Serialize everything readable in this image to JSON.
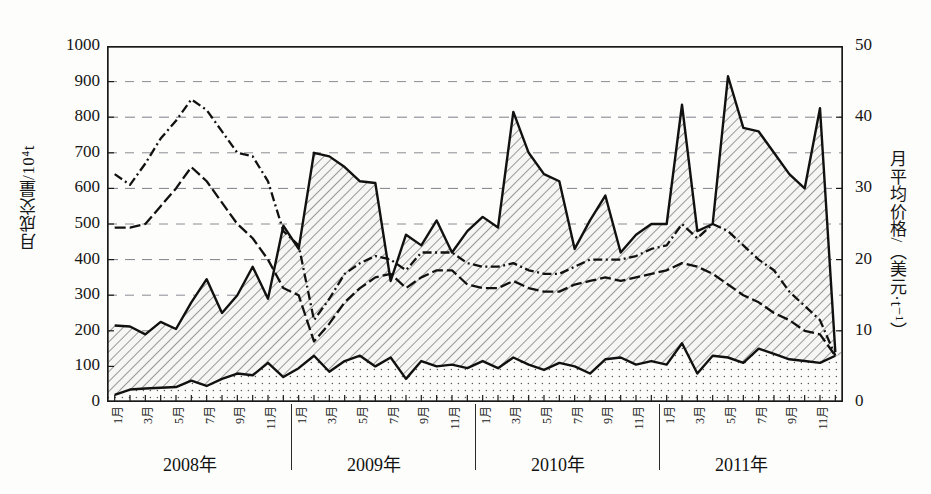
{
  "chart_data": {
    "type": "area",
    "title": "",
    "ylabel_left": "月成交量/10⁴t",
    "ylabel_right": "月平均价格/（美元·t⁻¹）",
    "xlabel": "",
    "ylim_left": [
      0,
      1000
    ],
    "ylim_right": [
      0,
      50
    ],
    "yticks_left": [
      "0",
      "100",
      "200",
      "300",
      "400",
      "500",
      "600",
      "700",
      "800",
      "900",
      "1000"
    ],
    "yticks_right": [
      "0",
      "10",
      "20",
      "30",
      "40",
      "50"
    ],
    "grid": true,
    "legend_position": "none",
    "x_month_ticks": [
      "1月",
      "3月",
      "5月",
      "7月",
      "9月",
      "11月"
    ],
    "years": [
      "2008年",
      "2009年",
      "2010年",
      "2011年"
    ],
    "x": [
      "2008-01",
      "2008-02",
      "2008-03",
      "2008-04",
      "2008-05",
      "2008-06",
      "2008-07",
      "2008-08",
      "2008-09",
      "2008-10",
      "2008-11",
      "2008-12",
      "2009-01",
      "2009-02",
      "2009-03",
      "2009-04",
      "2009-05",
      "2009-06",
      "2009-07",
      "2009-08",
      "2009-09",
      "2009-10",
      "2009-11",
      "2009-12",
      "2010-01",
      "2010-02",
      "2010-03",
      "2010-04",
      "2010-05",
      "2010-06",
      "2010-07",
      "2010-08",
      "2010-09",
      "2010-10",
      "2010-11",
      "2010-12",
      "2011-01",
      "2011-02",
      "2011-03",
      "2011-04",
      "2011-05",
      "2011-06",
      "2011-07",
      "2011-08",
      "2011-09",
      "2011-10",
      "2011-11",
      "2011-12"
    ],
    "series": [
      {
        "name": "月成交量上界（斜线填充区上缘）",
        "axis": "left",
        "style": "solid-line-hatched-area",
        "values": [
          215,
          212,
          190,
          225,
          205,
          280,
          345,
          250,
          300,
          380,
          290,
          495,
          430,
          700,
          690,
          660,
          620,
          615,
          340,
          470,
          440,
          510,
          420,
          480,
          520,
          490,
          815,
          700,
          640,
          620,
          430,
          510,
          580,
          420,
          470,
          500,
          500,
          835,
          480,
          500,
          915,
          770,
          760,
          700,
          640,
          600,
          825,
          140
        ]
      },
      {
        "name": "月成交量下界（点状填充区上缘）",
        "axis": "left",
        "style": "solid-line-dotted-area",
        "values": [
          20,
          35,
          38,
          40,
          42,
          60,
          45,
          65,
          80,
          75,
          110,
          70,
          95,
          130,
          85,
          115,
          130,
          100,
          125,
          65,
          115,
          100,
          105,
          95,
          115,
          95,
          125,
          105,
          90,
          110,
          100,
          80,
          120,
          125,
          105,
          115,
          105,
          165,
          80,
          130,
          125,
          110,
          150,
          135,
          120,
          115,
          110,
          130
        ]
      },
      {
        "name": "月平均价格（上线）",
        "axis": "right",
        "style": "dash-dot-line",
        "values": [
          32.0,
          30.5,
          33.5,
          37.0,
          39.5,
          42.5,
          41.0,
          38.0,
          35.0,
          34.5,
          31.0,
          24.0,
          22.0,
          11.5,
          14.5,
          18.0,
          19.5,
          20.5,
          20.0,
          18.5,
          21.0,
          21.0,
          21.0,
          19.5,
          19.0,
          19.0,
          19.5,
          18.5,
          18.0,
          18.0,
          19.0,
          20.0,
          20.0,
          20.0,
          20.5,
          21.5,
          22.0,
          25.0,
          23.0,
          25.0,
          24.0,
          22.0,
          20.0,
          18.5,
          15.5,
          13.5,
          11.5,
          6.5
        ]
      },
      {
        "name": "月平均价格（下线）",
        "axis": "right",
        "style": "dash-line",
        "values": [
          24.5,
          24.5,
          25.0,
          27.5,
          30.0,
          33.0,
          31.0,
          28.0,
          25.0,
          23.0,
          20.0,
          16.0,
          15.0,
          8.5,
          11.0,
          14.0,
          16.0,
          17.5,
          18.0,
          16.0,
          17.5,
          18.5,
          18.5,
          16.5,
          16.0,
          16.0,
          17.0,
          16.0,
          15.5,
          15.5,
          16.5,
          17.0,
          17.5,
          17.0,
          17.5,
          18.0,
          18.5,
          19.5,
          19.0,
          18.0,
          16.5,
          15.0,
          14.0,
          12.5,
          11.5,
          10.0,
          9.5,
          6.5
        ]
      }
    ],
    "colors": {
      "line": "#111111",
      "hatch_fill": "#f2f2f0",
      "dot_fill": "#fbfbfa",
      "grid": "#7f7f88",
      "frame": "#1a1a1a"
    }
  }
}
